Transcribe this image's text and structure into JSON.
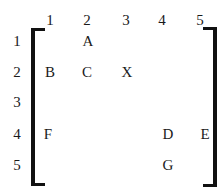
{
  "matrix": {
    "col_headers": [
      "1",
      "2",
      "3",
      "4",
      "5"
    ],
    "row_headers": [
      "1",
      "2",
      "3",
      "4",
      "5"
    ],
    "cells": [
      {
        "row": 1,
        "col": 2,
        "label": "A"
      },
      {
        "row": 2,
        "col": 1,
        "label": "B"
      },
      {
        "row": 2,
        "col": 2,
        "label": "C"
      },
      {
        "row": 2,
        "col": 3,
        "label": "X"
      },
      {
        "row": 4,
        "col": 1,
        "label": "F"
      },
      {
        "row": 4,
        "col": 4,
        "label": "D"
      },
      {
        "row": 4,
        "col": 5,
        "label": "E"
      },
      {
        "row": 5,
        "col": 4,
        "label": "G"
      }
    ]
  }
}
